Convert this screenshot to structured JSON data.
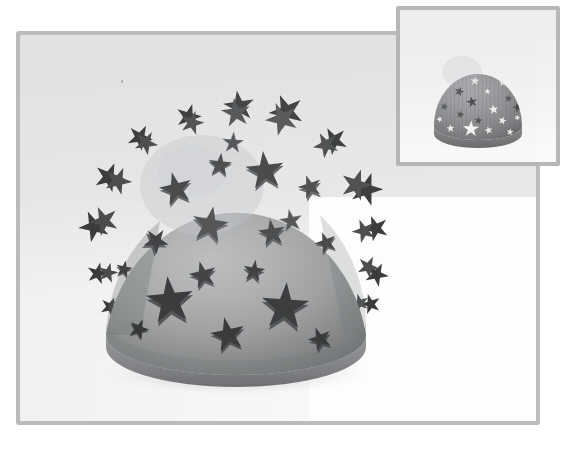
{
  "scene": {
    "title": "3D Star Dome Render",
    "background_color": "#ffffff",
    "canvas_tint_color": "#e4e5e6",
    "frame_border_color": "#b9bbbd",
    "inset_border_color": "#b5b7b9",
    "main_frame": {
      "x": 16,
      "y": 31,
      "width": 524,
      "height": 394,
      "border_width": 4
    },
    "inset_frame": {
      "x": 396,
      "y": 6,
      "width": 164,
      "height": 160,
      "border_width": 4
    }
  },
  "main_object": {
    "name": "star-studded-dome",
    "description": "Hemispherical dome shell with extruded five-pointed star studs protruding from the surface",
    "center_x": 232,
    "center_y": 232,
    "radius_x": 130,
    "radius_y": 134,
    "body_light_color": "#b4b6b8",
    "body_mid_color": "#9b9d9f",
    "body_dark_color": "#7d7f81",
    "rim_color": "#8b8d8f",
    "rim_shadow_color": "#707274",
    "star_top_color": "#4a4c4e",
    "star_side_light_color": "#6e7072",
    "star_side_dark_color": "#3b3d3f",
    "highlight_x_pct": 42,
    "highlight_y_pct": 30,
    "star_count_visible": 46,
    "truncation": "bottom flat cut with visible shell thickness rim"
  },
  "inset_object": {
    "name": "star-perforated-dome",
    "description": "Same dome with star-shaped perforations; some stars dark, some cut through to white",
    "center_x_pct": 50,
    "center_y_pct": 50,
    "radius_x_pct": 39,
    "radius_y_pct": 41,
    "body_light_color": "#9fa1a3",
    "body_mid_color": "#8e9092",
    "body_dark_color": "#76787a",
    "hole_light_color": "#f4f4f4",
    "hole_dark_color": "#585a5c",
    "star_count_visible": 36
  },
  "geometry": {
    "main_stars": [
      {
        "cx": 232,
        "cy": 110,
        "r": 16,
        "rot": -8,
        "shade": "dark",
        "depth": 7,
        "dir": "up"
      },
      {
        "cx": 190,
        "cy": 118,
        "r": 13,
        "rot": 14,
        "shade": "dark",
        "depth": 6,
        "dir": "up"
      },
      {
        "cx": 276,
        "cy": 116,
        "r": 18,
        "rot": -20,
        "shade": "dark",
        "depth": 8,
        "dir": "up"
      },
      {
        "cx": 148,
        "cy": 135,
        "r": 13,
        "rot": 30,
        "shade": "dark",
        "depth": 7,
        "dir": "left"
      },
      {
        "cx": 316,
        "cy": 138,
        "r": 13,
        "rot": -30,
        "shade": "dark",
        "depth": 7,
        "dir": "right"
      },
      {
        "cx": 215,
        "cy": 152,
        "r": 12,
        "rot": 5,
        "shade": "mid",
        "depth": 4,
        "dir": "up"
      },
      {
        "cx": 258,
        "cy": 155,
        "r": 20,
        "rot": -5,
        "shade": "dark",
        "depth": 6,
        "dir": "up"
      },
      {
        "cx": 122,
        "cy": 170,
        "r": 15,
        "rot": 22,
        "shade": "dark",
        "depth": 8,
        "dir": "left"
      },
      {
        "cx": 170,
        "cy": 175,
        "r": 17,
        "rot": -12,
        "shade": "dark",
        "depth": 5,
        "dir": "left"
      },
      {
        "cx": 340,
        "cy": 176,
        "r": 17,
        "rot": 18,
        "shade": "dark",
        "depth": 8,
        "dir": "right"
      },
      {
        "cx": 300,
        "cy": 180,
        "r": 12,
        "rot": -18,
        "shade": "mid",
        "depth": 4,
        "dir": "right"
      },
      {
        "cx": 106,
        "cy": 205,
        "r": 16,
        "rot": -25,
        "shade": "dark",
        "depth": 8,
        "dir": "left"
      },
      {
        "cx": 205,
        "cy": 212,
        "r": 19,
        "rot": 10,
        "shade": "mid",
        "depth": 4,
        "dir": "up"
      },
      {
        "cx": 266,
        "cy": 218,
        "r": 14,
        "rot": -8,
        "shade": "mid",
        "depth": 4,
        "dir": "right"
      },
      {
        "cx": 150,
        "cy": 228,
        "r": 13,
        "rot": 35,
        "shade": "dark",
        "depth": 5,
        "dir": "left"
      },
      {
        "cx": 345,
        "cy": 224,
        "r": 13,
        "rot": -22,
        "shade": "dark",
        "depth": 8,
        "dir": "right"
      },
      {
        "cx": 118,
        "cy": 252,
        "r": 9,
        "rot": 12,
        "shade": "dark",
        "depth": 5,
        "dir": "left"
      },
      {
        "cx": 197,
        "cy": 258,
        "r": 14,
        "rot": -16,
        "shade": "dark",
        "depth": 4,
        "dir": "up"
      },
      {
        "cx": 247,
        "cy": 252,
        "r": 11,
        "rot": 8,
        "shade": "dark",
        "depth": 4,
        "dir": "right"
      },
      {
        "cx": 352,
        "cy": 256,
        "r": 12,
        "rot": 26,
        "shade": "dark",
        "depth": 7,
        "dir": "right"
      },
      {
        "cx": 164,
        "cy": 284,
        "r": 23,
        "rot": -6,
        "shade": "dark",
        "depth": 4,
        "dir": "up"
      },
      {
        "cx": 279,
        "cy": 290,
        "r": 23,
        "rot": 4,
        "shade": "dark",
        "depth": 4,
        "dir": "right"
      },
      {
        "cx": 109,
        "cy": 283,
        "r": 11,
        "rot": 18,
        "shade": "dark",
        "depth": 6,
        "dir": "left"
      },
      {
        "cx": 339,
        "cy": 290,
        "r": 11,
        "rot": -18,
        "shade": "dark",
        "depth": 6,
        "dir": "right"
      },
      {
        "cx": 223,
        "cy": 318,
        "r": 17,
        "rot": -12,
        "shade": "dark",
        "depth": 4,
        "dir": "down"
      },
      {
        "cx": 135,
        "cy": 320,
        "r": 10,
        "rot": 24,
        "shade": "dark",
        "depth": 5,
        "dir": "left"
      },
      {
        "cx": 311,
        "cy": 324,
        "r": 13,
        "rot": -24,
        "shade": "dark",
        "depth": 5,
        "dir": "right"
      },
      {
        "cx": 180,
        "cy": 345,
        "r": 11,
        "rot": 16,
        "shade": "dark",
        "depth": 5,
        "dir": "down"
      },
      {
        "cx": 265,
        "cy": 348,
        "r": 12,
        "rot": -16,
        "shade": "dark",
        "depth": 5,
        "dir": "down"
      }
    ],
    "inset_stars": [
      {
        "cx": 46,
        "cy": 24,
        "r": 6,
        "rot": -10,
        "tone": "dark"
      },
      {
        "cx": 60,
        "cy": 18,
        "r": 4,
        "rot": 20,
        "tone": "dark"
      },
      {
        "cx": 70,
        "cy": 26,
        "r": 5,
        "rot": -15,
        "tone": "dark"
      },
      {
        "cx": 31,
        "cy": 32,
        "r": 4,
        "rot": 10,
        "tone": "dark"
      },
      {
        "cx": 55,
        "cy": 35,
        "r": 4,
        "rot": 5,
        "tone": "light"
      },
      {
        "cx": 79,
        "cy": 36,
        "r": 4,
        "rot": -5,
        "tone": "light"
      },
      {
        "cx": 89,
        "cy": 30,
        "r": 5,
        "rot": 12,
        "tone": "dark"
      },
      {
        "cx": 18,
        "cy": 42,
        "r": 4,
        "rot": -20,
        "tone": "light"
      },
      {
        "cx": 40,
        "cy": 45,
        "r": 5,
        "rot": 18,
        "tone": "dark"
      },
      {
        "cx": 66,
        "cy": 46,
        "r": 3,
        "rot": 0,
        "tone": "light"
      },
      {
        "cx": 51,
        "cy": 52,
        "r": 5,
        "rot": -12,
        "tone": "dark"
      },
      {
        "cx": 83,
        "cy": 51,
        "r": 4,
        "rot": 8,
        "tone": "dark"
      },
      {
        "cx": 27,
        "cy": 58,
        "r": 4,
        "rot": 25,
        "tone": "dark"
      },
      {
        "cx": 70,
        "cy": 62,
        "r": 5,
        "rot": -8,
        "tone": "light"
      },
      {
        "cx": 43,
        "cy": 66,
        "r": 4,
        "rot": 14,
        "tone": "dark"
      },
      {
        "cx": 90,
        "cy": 64,
        "r": 5,
        "rot": -18,
        "tone": "dark"
      },
      {
        "cx": 59,
        "cy": 74,
        "r": 4,
        "rot": 6,
        "tone": "dark"
      },
      {
        "cx": 22,
        "cy": 78,
        "r": 3,
        "rot": -22,
        "tone": "light"
      },
      {
        "cx": 79,
        "cy": 80,
        "r": 4,
        "rot": 16,
        "tone": "light"
      },
      {
        "cx": 36,
        "cy": 86,
        "r": 4,
        "rot": -6,
        "tone": "light"
      },
      {
        "cx": 52,
        "cy": 92,
        "r": 8,
        "rot": 2,
        "tone": "light"
      },
      {
        "cx": 68,
        "cy": 90,
        "r": 4,
        "rot": -14,
        "tone": "dark"
      },
      {
        "cx": 88,
        "cy": 94,
        "r": 4,
        "rot": 10,
        "tone": "light"
      },
      {
        "cx": 26,
        "cy": 96,
        "r": 3,
        "rot": 20,
        "tone": "light"
      },
      {
        "cx": 74,
        "cy": 100,
        "r": 4,
        "rot": -4,
        "tone": "light"
      }
    ]
  },
  "labels": {
    "main_view": "Perspective viewport",
    "inset_view": "Reference thumbnail",
    "speck": "stray render artifact"
  }
}
